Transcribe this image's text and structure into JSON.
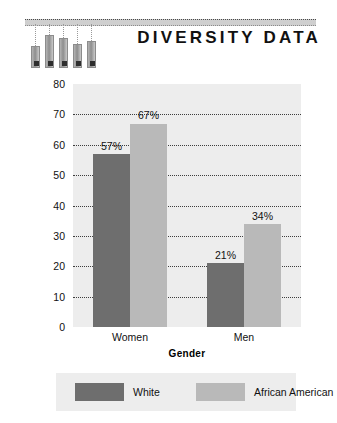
{
  "header": {
    "title": "DIVERSITY DATA",
    "rule_icon": "dotted-rule",
    "deco_icon": "thermometer-bars-decoration",
    "deco_heights": [
      22,
      33,
      30,
      24,
      27
    ]
  },
  "chart_data": {
    "type": "bar",
    "title": "DIVERSITY DATA",
    "categories": [
      "Women",
      "Men"
    ],
    "series": [
      {
        "name": "White",
        "color": "#6e6e6e",
        "values": [
          57,
          21
        ],
        "labels": [
          "57%",
          "21%"
        ]
      },
      {
        "name": "African American",
        "color": "#b9b9b9",
        "values": [
          67,
          34
        ],
        "labels": [
          "67%",
          "34%"
        ]
      }
    ],
    "xlabel": "Gender",
    "ylabel": "Percent Afraid to Walk Alone at Night",
    "ylim": [
      0,
      80
    ],
    "yticks": [
      80,
      70,
      60,
      50,
      40,
      30,
      20,
      10,
      0
    ],
    "ytick_labels": [
      "80",
      "70",
      "60",
      "50",
      "40",
      "30",
      "20",
      "10",
      "0"
    ],
    "grid": true,
    "gridlines_at": [
      70,
      60,
      50,
      40,
      30,
      20,
      10
    ],
    "legend_position": "bottom",
    "plot_background": "#ededed"
  },
  "legend": {
    "items": [
      {
        "label": "White",
        "swatch": "dark"
      },
      {
        "label": "African American",
        "swatch": "light"
      }
    ]
  }
}
